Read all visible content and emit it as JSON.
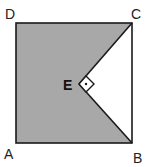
{
  "diagram": {
    "type": "geometry",
    "colors": {
      "shade": "#a8a8a8",
      "stroke": "#1a1a1a",
      "background": "#ffffff"
    },
    "points": {
      "A": {
        "label": "A",
        "x": 16,
        "y": 143
      },
      "B": {
        "label": "B",
        "x": 132,
        "y": 143
      },
      "C": {
        "label": "C",
        "x": 132,
        "y": 23
      },
      "D": {
        "label": "D",
        "x": 16,
        "y": 23
      },
      "E": {
        "label": "E",
        "x": 79,
        "y": 84
      }
    },
    "right_angle_marker": {
      "at": "E",
      "symbol": "dot-in-square"
    }
  }
}
